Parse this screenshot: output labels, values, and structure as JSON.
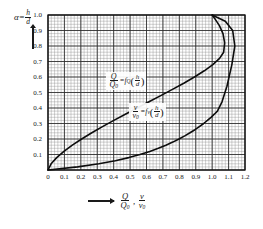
{
  "chart_data": {
    "type": "line",
    "title": "",
    "xlabel": "Q/Q0 , v/v0",
    "ylabel": "alpha = h/d",
    "xlim": [
      0,
      1.2
    ],
    "ylim": [
      0,
      1.0
    ],
    "grid": true,
    "grid_major_step": 0.1,
    "grid_minor_divisions": 5,
    "legend": "none",
    "xticks": [
      "0",
      "0.1",
      "0.2",
      "0.3",
      "0.4",
      "0.5",
      "0.6",
      "0.7",
      "0.8",
      "0.9",
      "1.0",
      "1.1",
      "1.2"
    ],
    "yticks": [
      "0.1",
      "0.2",
      "0.3",
      "0.4",
      "0.5",
      "0.6",
      "0.7",
      "0.8",
      "0.9",
      "1.0"
    ],
    "series": [
      {
        "name": "Q/Q0 = fQ(h/d)",
        "x": [
          0.0,
          0.019,
          0.053,
          0.097,
          0.148,
          0.205,
          0.267,
          0.332,
          0.401,
          0.471,
          0.543,
          0.615,
          0.687,
          0.758,
          0.827,
          0.892,
          0.952,
          1.004,
          1.045,
          1.07,
          1.076,
          1.066,
          1.045,
          1.02,
          1.0
        ],
        "y": [
          0.0,
          0.04,
          0.08,
          0.12,
          0.16,
          0.2,
          0.24,
          0.28,
          0.32,
          0.36,
          0.4,
          0.44,
          0.48,
          0.52,
          0.56,
          0.6,
          0.64,
          0.68,
          0.72,
          0.76,
          0.82,
          0.88,
          0.93,
          0.97,
          1.0
        ]
      },
      {
        "name": "v/v0 = fv(h/d)",
        "x": [
          0.0,
          0.18,
          0.31,
          0.41,
          0.492,
          0.56,
          0.62,
          0.672,
          0.718,
          0.76,
          0.798,
          0.833,
          0.865,
          0.895,
          0.922,
          0.948,
          0.971,
          0.993,
          1.013,
          1.032,
          1.06,
          1.09,
          1.12,
          1.138,
          1.125,
          1.08,
          1.0
        ],
        "y": [
          0.0,
          0.02,
          0.04,
          0.06,
          0.08,
          0.1,
          0.12,
          0.14,
          0.16,
          0.18,
          0.2,
          0.22,
          0.24,
          0.26,
          0.28,
          0.3,
          0.32,
          0.34,
          0.36,
          0.38,
          0.44,
          0.54,
          0.68,
          0.8,
          0.9,
          0.96,
          1.0
        ]
      }
    ],
    "annotations": [
      {
        "id": "annot-q",
        "text": "Q/Q0 = fQ(h/d)",
        "x": 0.56,
        "y": 0.59
      },
      {
        "id": "annot-v",
        "text": "v/v0 = fv(h/d)",
        "x": 0.7,
        "y": 0.39
      }
    ]
  },
  "axes": {
    "y_axis_label": {
      "symbol": "α",
      "equals": "=",
      "numerator": "h",
      "denominator": "d"
    },
    "x_axis_label": {
      "term1_num": "Q",
      "term1_den": "Q",
      "term1_den_sub": "0",
      "comma": ",",
      "term2_num": "v",
      "term2_den": "v",
      "term2_den_sub": "0"
    }
  },
  "annotation_q": {
    "num": "Q",
    "den": "Q",
    "den_sub": "0",
    "equals": "=",
    "fn": "f",
    "fn_sub": "Q",
    "open": "(",
    "arg_num": "h",
    "arg_den": "d",
    "close": ")"
  },
  "annotation_v": {
    "num": "v",
    "den": "v",
    "den_sub": "0",
    "equals": "=",
    "fn": "f",
    "fn_sub": "v",
    "open": "(",
    "arg_num": "h",
    "arg_den": "d",
    "close": ")"
  }
}
